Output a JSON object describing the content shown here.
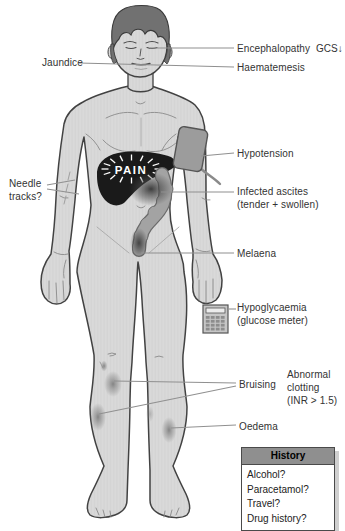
{
  "annotations": {
    "encephalopathy": "Encephalopathy  GCS↓",
    "jaundice": "Jaundice",
    "haematemesis": "Haematemesis",
    "hypotension": "Hypotension",
    "needle_tracks": "Needle\ntracks?",
    "infected_ascites": "Infected ascites\n(tender + swollen)",
    "melaena": "Melaena",
    "hypoglycaemia": "Hypoglycaemia\n(glucose meter)",
    "bruising": "Bruising",
    "abnormal_clotting": "Abnormal\nclotting\n(INR > 1.5)",
    "oedema": "Oedema",
    "pain": "PAIN"
  },
  "history": {
    "title": "History",
    "items": [
      "Alcohol?",
      "Paracetamol?",
      "Travel?",
      "Drug history?"
    ]
  },
  "colors": {
    "skin": "#d9d9d9",
    "outline": "#424242",
    "hair": "#717171",
    "liver": "#1a1a1a",
    "colon": "#a3a3a3",
    "bp_cuff": "#9c9c9c",
    "leader_line": "#909090",
    "label_text": "#333333",
    "history_header_bg": "#8f8f8f"
  }
}
